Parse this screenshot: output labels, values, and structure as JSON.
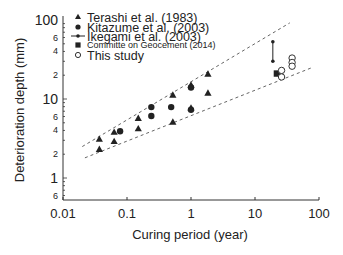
{
  "chart_data": {
    "type": "scatter",
    "title": "",
    "xlabel": "Curing period (year)",
    "ylabel": "Deterioration depth (mm)",
    "xscale": "log",
    "yscale": "log",
    "xlim": [
      0.01,
      100
    ],
    "ylim": [
      0.53,
      100
    ],
    "grid": false,
    "legend_position": "upper left",
    "x_ticks": [
      {
        "value": 0.01,
        "label": "0.01"
      },
      {
        "value": 0.1,
        "label": "0.1"
      },
      {
        "value": 1,
        "label": "1"
      },
      {
        "value": 10,
        "label": "10"
      },
      {
        "value": 100,
        "label": "100"
      }
    ],
    "y_ticks": [
      {
        "value": 100,
        "label": "100",
        "major": true
      },
      {
        "value": 60,
        "label": "6",
        "major": false
      },
      {
        "value": 40,
        "label": "4",
        "major": false
      },
      {
        "value": 20,
        "label": "2",
        "major": false
      },
      {
        "value": 10,
        "label": "10",
        "major": true
      },
      {
        "value": 6,
        "label": "6",
        "major": false
      },
      {
        "value": 4,
        "label": "4",
        "major": false
      },
      {
        "value": 2,
        "label": "2",
        "major": false
      },
      {
        "value": 1,
        "label": "1",
        "major": true
      },
      {
        "value": 0.6,
        "label": "6",
        "major": false
      }
    ],
    "series": [
      {
        "name": "Terashi et al. (1983)",
        "marker": "filled-triangle",
        "points": [
          [
            0.037,
            3.1
          ],
          [
            0.037,
            2.3
          ],
          [
            0.063,
            3.8
          ],
          [
            0.063,
            2.9
          ],
          [
            0.15,
            5.7
          ],
          [
            0.15,
            4.2
          ],
          [
            0.52,
            11.2
          ],
          [
            0.52,
            5.1
          ],
          [
            1.0,
            15
          ],
          [
            1.0,
            7.7
          ],
          [
            1.84,
            20.7
          ],
          [
            1.84,
            11.9
          ]
        ]
      },
      {
        "name": "Kitazume et al. (2003)",
        "marker": "filled-circle",
        "points": [
          [
            0.078,
            3.9
          ],
          [
            0.24,
            7.9
          ],
          [
            0.24,
            6.1
          ],
          [
            0.49,
            7.9
          ],
          [
            1.0,
            14
          ],
          [
            1.0,
            7.3
          ]
        ]
      },
      {
        "name": "Ikegami et al. (2003)",
        "marker": "range-line",
        "points": [
          [
            19,
            30
          ],
          [
            19,
            53
          ]
        ]
      },
      {
        "name": "Committe on Geocement (2014)",
        "marker": "filled-square",
        "points": [
          [
            22,
            21
          ]
        ]
      },
      {
        "name": "This study",
        "marker": "open-circle",
        "points": [
          [
            26,
            23
          ],
          [
            26,
            19
          ],
          [
            38,
            33
          ],
          [
            38,
            29
          ],
          [
            38,
            26
          ]
        ]
      }
    ],
    "annotations": [
      {
        "type": "dashed-line",
        "name": "upper-bound",
        "from": [
          0.02,
          2.5
        ],
        "to": [
          35,
          92
        ]
      },
      {
        "type": "dashed-line",
        "name": "lower-bound",
        "from": [
          0.022,
          1.8
        ],
        "to": [
          78,
          25
        ]
      }
    ]
  }
}
